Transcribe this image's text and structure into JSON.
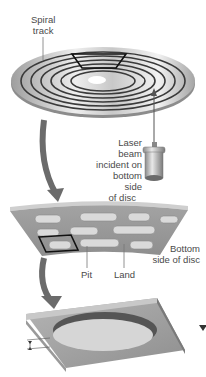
{
  "labels": {
    "spiral_track_1": "Spiral",
    "spiral_track_2": "track",
    "laser_1": "Laser beam",
    "laser_2": "incident on",
    "laser_3": "bottom side",
    "laser_4": "of disc",
    "bottom_1": "Bottom",
    "bottom_2": "side of disc",
    "pit": "Pit",
    "land": "Land"
  },
  "colors": {
    "disc_light": "#e6e6e6",
    "disc_dark": "#a9a9a9",
    "track": "#3a3a3a",
    "arrow": "#6b6b6b",
    "strip_top": "#9a9a9a",
    "pit_fill": "#d9d9d9"
  }
}
